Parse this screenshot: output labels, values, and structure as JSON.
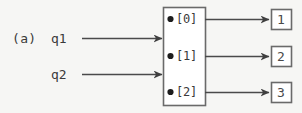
{
  "figure": {
    "panel_label": "(a)",
    "stroke_color": "#4a4a4a",
    "background_color": "#f6f6f4",
    "text_color": "#3a3a3a"
  },
  "inputs": [
    {
      "label": "q1",
      "arrow_icon": "arrow-right-icon"
    },
    {
      "label": "q2",
      "arrow_icon": "arrow-right-icon"
    }
  ],
  "component": {
    "name": "port-array-box",
    "ports": [
      {
        "marker_icon": "bullet-icon",
        "label": "[0]"
      },
      {
        "marker_icon": "bullet-icon",
        "label": "[1]"
      },
      {
        "marker_icon": "bullet-icon",
        "label": "[2]"
      }
    ]
  },
  "outputs": [
    {
      "label": "1",
      "arrow_icon": "arrow-right-icon"
    },
    {
      "label": "2",
      "arrow_icon": "arrow-right-icon"
    },
    {
      "label": "3",
      "arrow_icon": "arrow-right-icon"
    }
  ]
}
